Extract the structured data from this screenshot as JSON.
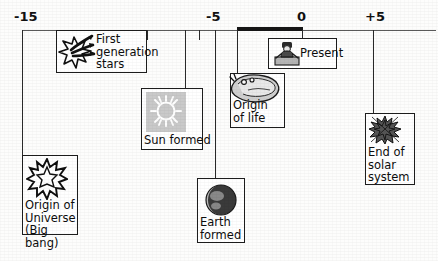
{
  "figure": {
    "type": "timeline",
    "axis": {
      "ticks": [
        {
          "label": "-15",
          "x": 22
        },
        {
          "label": "-5",
          "x": 213
        },
        {
          "label": "0",
          "x": 302
        },
        {
          "label": "+5",
          "x": 373
        }
      ],
      "range": [
        -15,
        5
      ],
      "highlight_segment": {
        "from": -2.5,
        "to": 0
      }
    },
    "events": [
      {
        "id": "first-generation-stars",
        "label": "First\ngeneration\nstars",
        "icon": "starburst-rays-icon",
        "axis_position": -12
      },
      {
        "id": "origin-of-universe",
        "label": "Origin of\nUniverse\n(Big bang)",
        "icon": "big-bang-explosion-icon",
        "axis_position": -15
      },
      {
        "id": "sun-formed",
        "label": "Sun formed",
        "icon": "sun-icon",
        "axis_position": -9
      },
      {
        "id": "earth-formed",
        "label": "Earth\nformed",
        "icon": "earth-globe-icon",
        "axis_position": -4.6
      },
      {
        "id": "origin-of-life",
        "label": "Origin\nof life",
        "icon": "primitive-life-icon",
        "axis_position": -3.5
      },
      {
        "id": "present",
        "label": "Present",
        "icon": "person-present-icon",
        "axis_position": 0
      },
      {
        "id": "end-of-solar-system",
        "label": "End of\nsolar\nsystem",
        "icon": "exploding-star-icon",
        "axis_position": 5
      }
    ],
    "colors": {
      "line": "#2a2a2a",
      "box_border": "#1d1d1d",
      "text": "#0d0d0d",
      "highlight": "#161616",
      "tile_gray": "#c9c9c9",
      "background": "#fdfdfc"
    }
  }
}
